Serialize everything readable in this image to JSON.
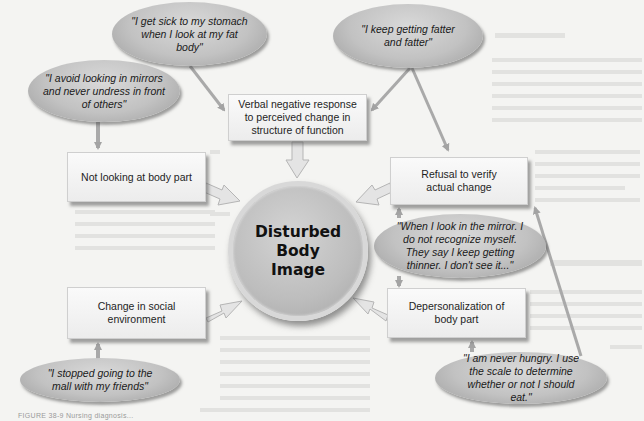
{
  "diagram": {
    "center": {
      "label": "Disturbed\nBody\nImage"
    },
    "boxes": [
      {
        "id": "verbal",
        "label": "Verbal negative response to perceived change in structure of function"
      },
      {
        "id": "not-looking",
        "label": "Not looking at body part"
      },
      {
        "id": "refusal",
        "label": "Refusal to verify actual change"
      },
      {
        "id": "social",
        "label": "Change in social environment"
      },
      {
        "id": "depersonalization",
        "label": "Depersonalization of body part"
      }
    ],
    "quotes": [
      {
        "id": "sick",
        "text": "\"I get sick to my stomach when I look at my fat body\""
      },
      {
        "id": "fatter",
        "text": "\"I keep getting fatter and fatter\""
      },
      {
        "id": "mirrors",
        "text": "\"I avoid looking in mirrors and never undress in front of others\""
      },
      {
        "id": "mirror-recognize",
        "text": "\"When I look in the mirror. I do not recognize myself. They say I keep getting thinner. I don't see it...\""
      },
      {
        "id": "mall",
        "text": "\"I stopped going to the mall with my friends\""
      },
      {
        "id": "hungry",
        "text": "\"I am never hungry. I use the scale to determine whether or not I should eat.\""
      }
    ],
    "caption": "FIGURE 38-9  Nursing diagnosis..."
  },
  "colors": {
    "background": "#f4f4f2",
    "box_fill": "#f2f2f2",
    "quote_fill": "#c4c4c4",
    "circle_fill": "#bebebe",
    "arrow": "#a9a9a9",
    "text": "#1e1e1e"
  }
}
